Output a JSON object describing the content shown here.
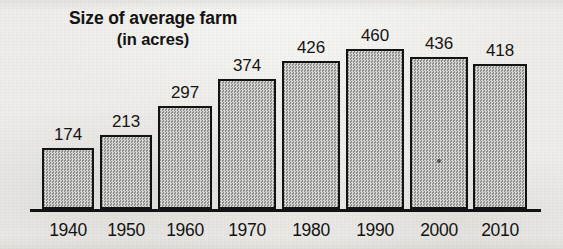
{
  "chart_data": {
    "type": "bar",
    "title": "Size of average farm",
    "subtitle": "(in acres)",
    "xlabel": "",
    "ylabel": "",
    "categories": [
      "1940",
      "1950",
      "1960",
      "1970",
      "1980",
      "1990",
      "2000",
      "2010"
    ],
    "values": [
      174,
      213,
      297,
      374,
      426,
      460,
      436,
      418
    ],
    "value_labels": [
      "174",
      "213",
      "297",
      "374",
      "426",
      "460",
      "436",
      "418"
    ],
    "ylim": [
      0,
      460
    ],
    "grid": false,
    "legend": null,
    "axis": {
      "baseline_visible": true,
      "y_axis_visible": false,
      "tick_labels_visible": false
    },
    "style": {
      "bar_fill": "#aaaaa8",
      "bar_border": "#131313",
      "text_color": "#131313",
      "background": "#eeedea",
      "axis_color": "#121212"
    }
  },
  "geometry": {
    "baseline_y": 209,
    "axis_left": 30,
    "axis_width": 511,
    "px_per_unit": 0.3478,
    "bars": [
      {
        "left": 42,
        "width": 52
      },
      {
        "left": 100,
        "width": 52
      },
      {
        "left": 158,
        "width": 54
      },
      {
        "left": 218,
        "width": 58
      },
      {
        "left": 282,
        "width": 58
      },
      {
        "left": 346,
        "width": 58
      },
      {
        "left": 410,
        "width": 58
      },
      {
        "left": 473,
        "width": 54
      }
    ]
  }
}
